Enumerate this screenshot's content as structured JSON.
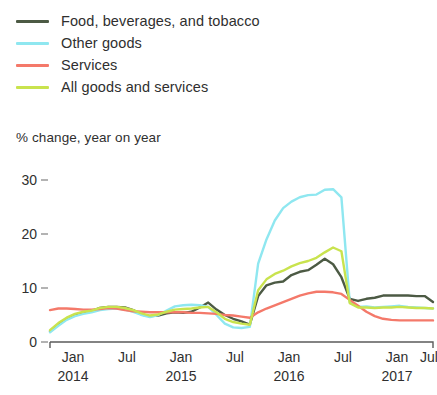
{
  "legend": {
    "position": "top-left",
    "items": [
      {
        "label": "Food, beverages, and tobacco",
        "color": "#4c5a44",
        "key": "food_beverages_tobacco"
      },
      {
        "label": "Other goods",
        "color": "#8fe7f0",
        "key": "other_goods"
      },
      {
        "label": "Services",
        "color": "#f4796a",
        "key": "services"
      },
      {
        "label": "All goods and services",
        "color": "#c9e34e",
        "key": "all_goods_and_services"
      }
    ]
  },
  "axis_title": "% change, year on year",
  "chart_data": {
    "type": "line",
    "title": "",
    "subtitle": "% change, year on year",
    "xlabel": "",
    "ylabel": "% change, year on year",
    "ylim": [
      0,
      32
    ],
    "yticks": [
      0,
      10,
      20,
      30
    ],
    "ytick_labels": [
      "0",
      "10",
      "20",
      "30"
    ],
    "grid": false,
    "legend_position": "top-left",
    "x_axis": {
      "tick_labels": [
        "Jan",
        "Jul",
        "Jan",
        "Jul",
        "Jan",
        "Jul",
        "Jan",
        "Jul"
      ],
      "year_labels": [
        "2014",
        "",
        "2015",
        "",
        "2016",
        "",
        "2017",
        ""
      ],
      "start": "2014-01",
      "end": "2017-11",
      "frequency": "monthly"
    },
    "x": [
      "2014-01",
      "2014-02",
      "2014-03",
      "2014-04",
      "2014-05",
      "2014-06",
      "2014-07",
      "2014-08",
      "2014-09",
      "2014-10",
      "2014-11",
      "2014-12",
      "2015-01",
      "2015-02",
      "2015-03",
      "2015-04",
      "2015-05",
      "2015-06",
      "2015-07",
      "2015-08",
      "2015-09",
      "2015-10",
      "2015-11",
      "2015-12",
      "2016-01",
      "2016-02",
      "2016-03",
      "2016-04",
      "2016-05",
      "2016-06",
      "2016-07",
      "2016-08",
      "2016-09",
      "2016-10",
      "2016-11",
      "2016-12",
      "2017-01",
      "2017-02",
      "2017-03",
      "2017-04",
      "2017-05",
      "2017-06",
      "2017-07",
      "2017-08",
      "2017-09",
      "2017-10",
      "2017-11"
    ],
    "series": [
      {
        "name": "Food, beverages, and tobacco",
        "color": "#4c5a44",
        "values": [
          2.0,
          3.2,
          4.3,
          5.0,
          5.4,
          5.7,
          6.3,
          6.5,
          6.5,
          6.4,
          5.9,
          5.1,
          4.8,
          4.9,
          5.3,
          5.5,
          5.4,
          5.6,
          6.4,
          7.3,
          6.0,
          5.0,
          4.3,
          3.8,
          3.2,
          8.5,
          10.5,
          11.0,
          11.2,
          12.4,
          13.0,
          13.3,
          14.3,
          15.4,
          14.4,
          12.0,
          8.0,
          7.6,
          8.0,
          8.2,
          8.6,
          8.6,
          8.6,
          8.6,
          8.5,
          8.5,
          7.4
        ]
      },
      {
        "name": "Other goods",
        "color": "#8fe7f0",
        "values": [
          1.8,
          3.0,
          4.1,
          4.8,
          5.2,
          5.5,
          5.9,
          6.1,
          6.2,
          6.0,
          5.6,
          5.0,
          4.6,
          5.0,
          5.8,
          6.6,
          6.8,
          6.9,
          6.8,
          6.5,
          5.0,
          3.4,
          2.7,
          2.6,
          2.8,
          14.5,
          19.0,
          22.5,
          24.8,
          26.0,
          26.8,
          27.2,
          27.3,
          28.2,
          28.3,
          26.8,
          7.4,
          6.5,
          6.6,
          6.4,
          6.5,
          6.6,
          6.7,
          6.5,
          6.4,
          6.3,
          6.2
        ]
      },
      {
        "name": "Services",
        "color": "#f4796a",
        "values": [
          5.9,
          6.2,
          6.2,
          6.1,
          6.0,
          6.0,
          6.1,
          6.3,
          6.2,
          5.9,
          5.7,
          5.6,
          5.5,
          5.5,
          5.5,
          5.5,
          5.5,
          5.4,
          5.4,
          5.3,
          5.2,
          5.0,
          4.9,
          4.7,
          4.5,
          5.5,
          6.2,
          6.8,
          7.4,
          8.0,
          8.6,
          9.0,
          9.3,
          9.3,
          9.2,
          8.9,
          7.8,
          6.7,
          5.6,
          4.8,
          4.3,
          4.1,
          4.0,
          4.0,
          4.0,
          4.0,
          4.0
        ]
      },
      {
        "name": "All goods and services",
        "color": "#c9e34e",
        "values": [
          2.2,
          3.5,
          4.5,
          5.2,
          5.6,
          5.8,
          6.3,
          6.5,
          6.5,
          6.3,
          5.9,
          5.3,
          4.9,
          5.1,
          5.6,
          6.0,
          6.1,
          6.2,
          6.4,
          6.5,
          5.5,
          4.3,
          3.7,
          3.4,
          3.2,
          9.6,
          11.6,
          12.6,
          13.2,
          14.0,
          14.6,
          15.0,
          15.6,
          16.6,
          17.5,
          16.8,
          7.2,
          6.4,
          6.4,
          6.3,
          6.4,
          6.4,
          6.5,
          6.4,
          6.3,
          6.3,
          6.2
        ]
      }
    ]
  },
  "geometry": {
    "plot_left": 50,
    "plot_right": 433,
    "y_zero_px": 342,
    "px_per_unit": 5.4,
    "xtick_px": [
      73,
      127,
      181,
      235,
      289,
      343,
      397,
      429
    ],
    "xtick_label_y": 362,
    "xyear_label_y": 381,
    "ytick_px": {
      "0": 342,
      "10": 288,
      "20": 234,
      "30": 180
    }
  }
}
